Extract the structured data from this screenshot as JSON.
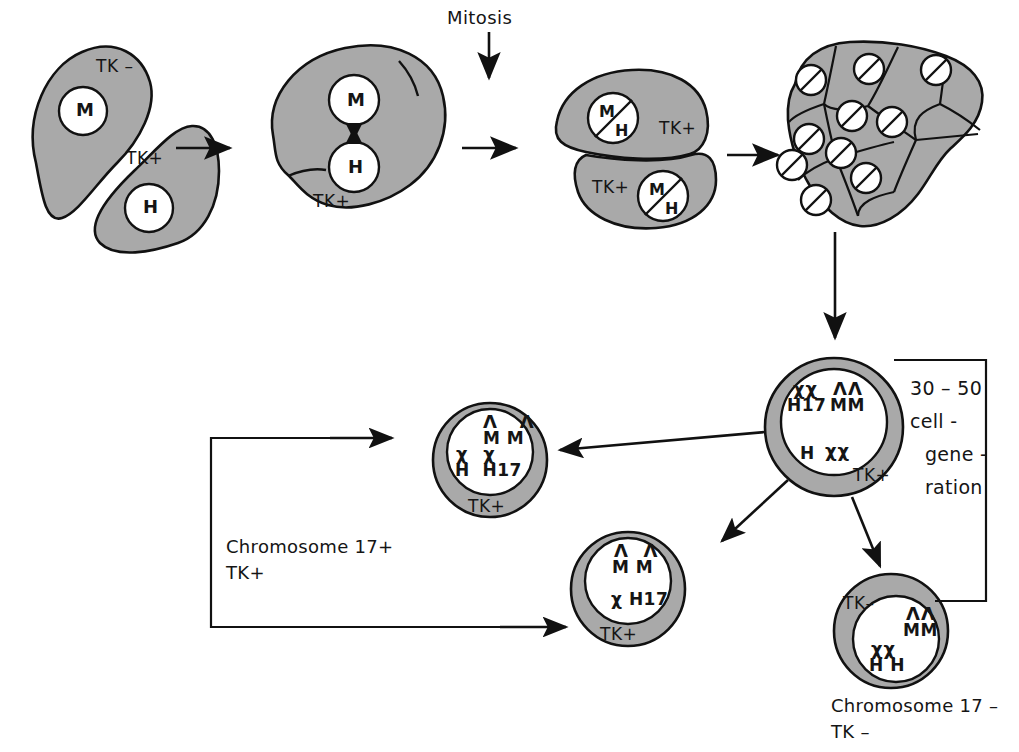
{
  "figure": {
    "title_label": "Mitosis",
    "colors": {
      "cell_fill": "#a9a9a9",
      "nucleus_fill": "#ffffff",
      "stroke": "#111111"
    }
  },
  "stage1": {
    "name": "parental-cells",
    "cell_a": {
      "marker": "TK –",
      "nucleus": "M"
    },
    "cell_b": {
      "marker": "TK+",
      "nucleus": "H"
    }
  },
  "stage2": {
    "name": "fused-heterokaryon",
    "marker": "TK+",
    "nucleus_top": "M",
    "nucleus_bottom": "H"
  },
  "stage3": {
    "name": "daughter-cells",
    "upper": {
      "marker": "TK+",
      "nucleus_top": "M",
      "nucleus_bottom": "H"
    },
    "lower": {
      "marker": "TK+",
      "nucleus_top": "M",
      "nucleus_bottom": "H"
    }
  },
  "stage4": {
    "name": "hybrid-colony",
    "cell_count": 10
  },
  "hybrid": {
    "name": "hybrid-cell-tk-positive",
    "marker": "TK+",
    "row1_sym_left": "χχ",
    "row1_left": "H17",
    "row1_sym_right": "ΛΛ",
    "row1_right": "MM",
    "row2_left": "H",
    "row2_sym_right": "χχ"
  },
  "generation": {
    "line1": "30 – 50",
    "line2": "cell -",
    "line3": "gene -",
    "line4": "ration"
  },
  "segregant_top": {
    "name": "segregant-chromosome-17-positive",
    "marker": "TK+",
    "sym_top": "Λ   Λ",
    "label_top": "M M",
    "sym_mid": "χ  χ",
    "label_bottom": "H  H17"
  },
  "segregant_mid": {
    "name": "segregant-tk-positive",
    "marker": "TK+",
    "sym_top": "Λ  Λ",
    "label_top": "M M",
    "label_bottom": "χ H17"
  },
  "segregant_bottom": {
    "name": "segregant-chromosome-17-negative",
    "marker": "TK–",
    "sym_top": "ΛΛ",
    "label_top": "MM",
    "sym_mid": "χχ",
    "label_bottom": "H H"
  },
  "captions": {
    "left_line1": "Chromosome 17+",
    "left_line2": "TK+",
    "right_line1": "Chromosome 17 –",
    "right_line2": "TK –"
  }
}
